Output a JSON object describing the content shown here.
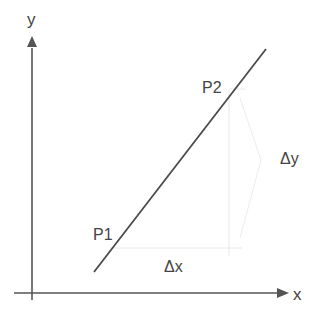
{
  "diagram": {
    "axes": {
      "x_label": "x",
      "y_label": "y"
    },
    "points": {
      "p1_label": "P1",
      "p2_label": "P2"
    },
    "deltas": {
      "dx_label": "Δx",
      "dy_label": "Δy"
    },
    "colors": {
      "axis": "#555555",
      "line": "#444444",
      "guide": "#e6e6e6",
      "text": "#444444"
    }
  }
}
